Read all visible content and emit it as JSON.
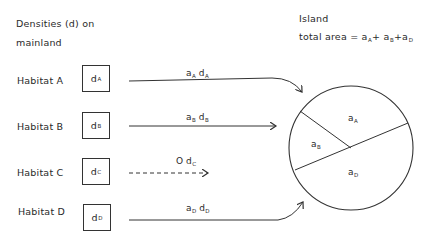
{
  "mainland": {
    "heading_line1": "Densities (d) on",
    "heading_line2": "mainland",
    "habitats": [
      {
        "label": "Habitat A",
        "density": "d",
        "sub": "A",
        "flow": "a",
        "flow_sub": "A",
        "flow_d": "d",
        "flow_dsub": "A",
        "arrow": "solid-curved-to-island"
      },
      {
        "label": "Habitat B",
        "density": "d",
        "sub": "B",
        "flow": "a",
        "flow_sub": "B",
        "flow_d": "d",
        "flow_dsub": "B",
        "arrow": "solid-straight-to-island"
      },
      {
        "label": "Habitat C",
        "density": "d",
        "sub": "C",
        "flow": "O",
        "flow_sub": "",
        "flow_d": "d",
        "flow_dsub": "C",
        "arrow": "dashed-short"
      },
      {
        "label": "Habitat D",
        "density": "d",
        "sub": "D",
        "flow": "a",
        "flow_sub": "D",
        "flow_d": "d",
        "flow_dsub": "D",
        "arrow": "solid-curved-to-island"
      }
    ]
  },
  "island": {
    "title": "Island",
    "area_label": "total area = ",
    "area_terms": [
      {
        "a": "a",
        "sub": "A",
        "sep": "+ "
      },
      {
        "a": "a",
        "sub": "B",
        "sep": "+"
      },
      {
        "a": "a",
        "sub": "D",
        "sep": ""
      }
    ],
    "regions": [
      {
        "a": "a",
        "sub": "A"
      },
      {
        "a": "a",
        "sub": "B"
      },
      {
        "a": "a",
        "sub": "D"
      }
    ]
  },
  "colors": {
    "ink": "#2a2a2a",
    "background": "#ffffff"
  }
}
